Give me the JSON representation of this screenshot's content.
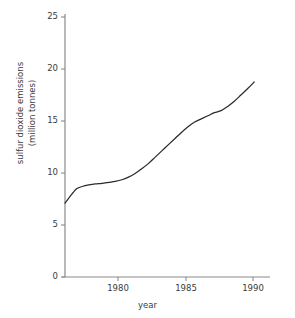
{
  "title_fragment": "",
  "axes": {
    "xlabel": "year",
    "ylabel_line1": "sulfur dioxide emissions",
    "ylabel_line2": "(million tonnes)",
    "yticks": [
      "0",
      "5",
      "10",
      "15",
      "20",
      "25"
    ],
    "xticks": [
      "1980",
      "1985",
      "1990"
    ]
  },
  "colors": {
    "line": "#2b2b2b",
    "axis": "#8a8a8a",
    "text": "#3b3b3b",
    "background": "#ffffff"
  },
  "chart_data": {
    "type": "line",
    "title": "",
    "xlabel": "year",
    "ylabel": "sulfur dioxide emissions (million tonnes)",
    "xlim": [
      1975.7,
      1991.2
    ],
    "ylim": [
      0,
      25
    ],
    "yticks": [
      0,
      5,
      10,
      15,
      20,
      25
    ],
    "xticks": [
      1980,
      1985,
      1990
    ],
    "grid": false,
    "legend": "none",
    "series": [
      {
        "name": "sulfur dioxide emissions",
        "x": [
          1975.7,
          1976.0,
          1976.3,
          1976.6,
          1977.0,
          1977.5,
          1978.0,
          1978.5,
          1979.0,
          1979.5,
          1980.0,
          1980.5,
          1981.0,
          1981.5,
          1982.0,
          1982.5,
          1983.0,
          1983.5,
          1984.0,
          1984.5,
          1985.0,
          1985.5,
          1986.0,
          1986.5,
          1987.0,
          1987.5,
          1988.0,
          1988.5,
          1989.0,
          1989.5,
          1990.0
        ],
        "y": [
          7.1,
          7.6,
          8.1,
          8.5,
          8.7,
          8.85,
          8.95,
          9.0,
          9.1,
          9.2,
          9.35,
          9.6,
          9.95,
          10.4,
          10.9,
          11.5,
          12.1,
          12.7,
          13.3,
          13.9,
          14.45,
          14.9,
          15.2,
          15.5,
          15.8,
          16.0,
          16.4,
          16.9,
          17.5,
          18.1,
          18.75
        ]
      }
    ]
  }
}
